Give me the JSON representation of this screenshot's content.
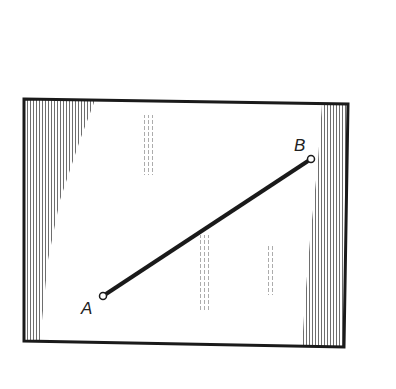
{
  "diagram": {
    "type": "geometry-figure",
    "frame": {
      "corners": {
        "top_left": [
          24,
          99
        ],
        "top_right": [
          348,
          104
        ],
        "bottom_right": [
          344,
          347
        ],
        "bottom_left": [
          24,
          341
        ]
      },
      "stroke_color": "#1a1a1a",
      "fill_color": "#ffffff",
      "shading_color": "#555555"
    },
    "segment": {
      "start": {
        "label": "A",
        "x": 103,
        "y": 296
      },
      "end": {
        "label": "B",
        "x": 311,
        "y": 159
      },
      "color": "#1a1a1a"
    },
    "labels": {
      "point_a": "A",
      "point_b": "B"
    }
  }
}
